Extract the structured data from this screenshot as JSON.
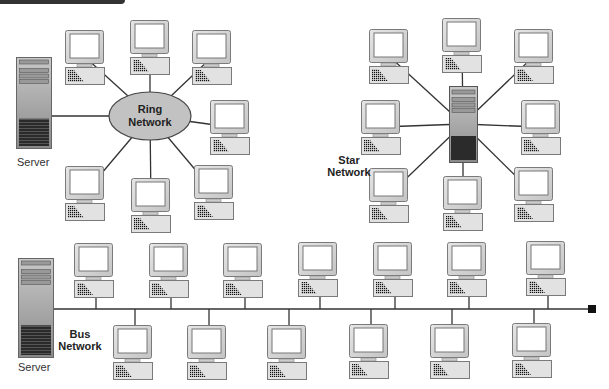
{
  "diagram": {
    "colors": {
      "line": "#333333",
      "device_fill": "#d8d8d8",
      "device_border": "#7a7a7a",
      "ellipse_fill": "#c2c2c2",
      "header_bar": "#333333",
      "terminator": "#111111"
    },
    "ring_network": {
      "label_line1": "Ring",
      "label_line2": "Network",
      "server_label": "Server",
      "hub": {
        "shape": "ellipse",
        "cx": 150,
        "cy": 116,
        "rx": 41,
        "ry": 24
      },
      "server": {
        "x": 16,
        "y": 57,
        "w": 35,
        "h": 91
      },
      "computers": [
        {
          "x": 65,
          "y": 30
        },
        {
          "x": 130,
          "y": 20
        },
        {
          "x": 192,
          "y": 30
        },
        {
          "x": 210,
          "y": 100
        },
        {
          "x": 194,
          "y": 165
        },
        {
          "x": 131,
          "y": 178
        },
        {
          "x": 65,
          "y": 166
        }
      ]
    },
    "star_network": {
      "label_line1": "Star",
      "label_line2": "Network",
      "hub": {
        "shape": "server",
        "x": 449,
        "y": 86,
        "w": 28,
        "h": 76
      },
      "computers": [
        {
          "x": 369,
          "y": 29
        },
        {
          "x": 442,
          "y": 18
        },
        {
          "x": 514,
          "y": 29
        },
        {
          "x": 521,
          "y": 100
        },
        {
          "x": 514,
          "y": 167
        },
        {
          "x": 443,
          "y": 176
        },
        {
          "x": 369,
          "y": 168
        },
        {
          "x": 361,
          "y": 100
        }
      ]
    },
    "bus_network": {
      "label_line1": "Bus",
      "label_line2": "Network",
      "server_label": "Server",
      "server": {
        "x": 18,
        "y": 258,
        "w": 35,
        "h": 99
      },
      "bus_y": 309,
      "bus_x_start": 53,
      "bus_x_end": 591,
      "terminator": {
        "x": 588,
        "y": 305,
        "size": 8
      },
      "top_computers": [
        {
          "x": 74,
          "y": 243
        },
        {
          "x": 149,
          "y": 243
        },
        {
          "x": 223,
          "y": 243
        },
        {
          "x": 298,
          "y": 242
        },
        {
          "x": 373,
          "y": 242
        },
        {
          "x": 447,
          "y": 242
        },
        {
          "x": 526,
          "y": 241
        }
      ],
      "bottom_computers": [
        {
          "x": 113,
          "y": 325
        },
        {
          "x": 187,
          "y": 325
        },
        {
          "x": 267,
          "y": 325
        },
        {
          "x": 349,
          "y": 324
        },
        {
          "x": 430,
          "y": 324
        },
        {
          "x": 512,
          "y": 323
        }
      ]
    }
  }
}
